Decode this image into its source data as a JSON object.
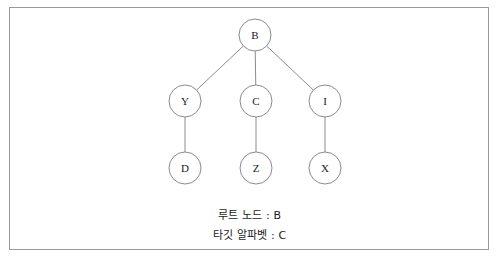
{
  "diagram": {
    "type": "tree",
    "title": "",
    "frame": {
      "border_color": "#9a9a9a",
      "background": "#ffffff"
    },
    "node_style": {
      "stroke": "#8a8a96",
      "fill": "#ffffff",
      "radius": 16
    },
    "edge_style": {
      "stroke": "#8a8a96"
    },
    "nodes": [
      {
        "id": "B",
        "label": "B",
        "x": 255,
        "y": 35
      },
      {
        "id": "Y",
        "label": "Y",
        "x": 185,
        "y": 101
      },
      {
        "id": "C",
        "label": "C",
        "x": 256,
        "y": 101
      },
      {
        "id": "I",
        "label": "I",
        "x": 325,
        "y": 101
      },
      {
        "id": "D",
        "label": "D",
        "x": 185,
        "y": 168
      },
      {
        "id": "Z",
        "label": "Z",
        "x": 256,
        "y": 168
      },
      {
        "id": "X",
        "label": "X",
        "x": 325,
        "y": 168
      }
    ],
    "edges": [
      {
        "from": "B",
        "to": "Y"
      },
      {
        "from": "B",
        "to": "C"
      },
      {
        "from": "B",
        "to": "I"
      },
      {
        "from": "Y",
        "to": "D"
      },
      {
        "from": "C",
        "to": "Z"
      },
      {
        "from": "I",
        "to": "X"
      }
    ]
  },
  "captions": {
    "root_node": "루트 노드 : B",
    "target_alphabet": "타깃 알파벳 : C"
  }
}
